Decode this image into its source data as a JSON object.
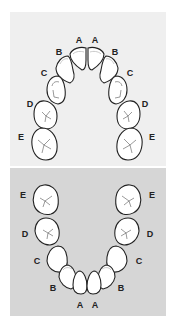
{
  "colors": {
    "upper_panel": "#efefef",
    "lower_panel": "#d6d6d6",
    "tooth_fill": "#ffffff",
    "tooth_outline": "#222222"
  },
  "upper_arch": {
    "labels_left": [
      "A",
      "B",
      "C",
      "D",
      "E"
    ],
    "labels_right": [
      "A",
      "B",
      "C",
      "D",
      "E"
    ]
  },
  "lower_arch": {
    "labels_left": [
      "E",
      "D",
      "C",
      "B",
      "A"
    ],
    "labels_right": [
      "E",
      "D",
      "C",
      "B",
      "A"
    ]
  }
}
